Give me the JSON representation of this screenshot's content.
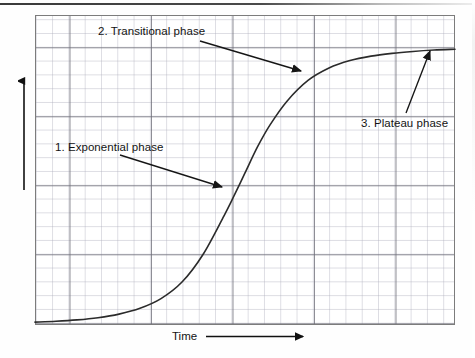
{
  "figure": {
    "kind": "scanned-line-graph",
    "background_color": "#fefefe",
    "frame_color": "#7c7c7c",
    "curve_color": "#2b2b2b",
    "grid_minor_color": "#aaaab9",
    "grid_major_color": "#6e6e78"
  },
  "axes": {
    "y_label": "Population size",
    "x_label": "Time",
    "y_arrow_icon": "up-arrow-icon",
    "x_arrow_icon": "right-arrow-icon"
  },
  "annotations": [
    {
      "id": "exponential",
      "label": "1. Exponential phase",
      "arrow_from": [
        120,
        155
      ],
      "arrow_to": [
        222,
        187
      ]
    },
    {
      "id": "transitional",
      "label": "2. Transitional phase",
      "arrow_from": [
        200,
        41
      ],
      "arrow_to": [
        301,
        71
      ]
    },
    {
      "id": "plateau",
      "label": "3. Plateau phase",
      "arrow_from": [
        406,
        113
      ],
      "arrow_to": [
        430,
        51
      ]
    }
  ],
  "chart_data": {
    "type": "line",
    "title": "",
    "xlabel": "Time",
    "ylabel": "Population size",
    "grid": true,
    "legend": false,
    "xlim": [
      0,
      1
    ],
    "ylim": [
      0,
      1
    ],
    "axis_ticks_labeled": false,
    "curve_description": "Sigmoid (logistic) population growth curve: slow lag start, steep exponential rise, then plateau at carrying capacity.",
    "series": [
      {
        "name": "Population growth",
        "x": [
          0.0,
          0.05,
          0.1,
          0.15,
          0.2,
          0.25,
          0.3,
          0.35,
          0.4,
          0.45,
          0.47,
          0.5,
          0.53,
          0.56,
          0.6,
          0.65,
          0.7,
          0.75,
          0.8,
          0.85,
          0.9,
          0.95,
          1.0
        ],
        "y": [
          0.005,
          0.008,
          0.013,
          0.021,
          0.034,
          0.055,
          0.09,
          0.15,
          0.25,
          0.39,
          0.45,
          0.545,
          0.64,
          0.72,
          0.805,
          0.88,
          0.925,
          0.952,
          0.968,
          0.978,
          0.985,
          0.99,
          0.993
        ]
      }
    ],
    "phases": [
      {
        "index": 1,
        "name": "Exponential phase",
        "x_range": [
          0.25,
          0.5
        ]
      },
      {
        "index": 2,
        "name": "Transitional phase",
        "x_range": [
          0.5,
          0.75
        ]
      },
      {
        "index": 3,
        "name": "Plateau phase",
        "x_range": [
          0.75,
          1.0
        ]
      }
    ],
    "asymptote_y": 1.0
  }
}
